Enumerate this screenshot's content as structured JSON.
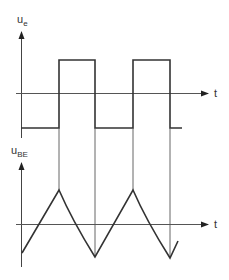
{
  "diagram": {
    "title": "",
    "top_plot": {
      "y_label": "u",
      "y_label_sub": "e",
      "x_label": "t",
      "waveform": "square",
      "levels": [
        "high",
        "low"
      ]
    },
    "bottom_plot": {
      "y_label": "u",
      "y_label_sub": "BE",
      "x_label": "t",
      "waveform": "triangle (capacitor charge/discharge)"
    },
    "colors": {
      "stroke": "#333333",
      "guide": "#555555",
      "background": "#ffffff"
    }
  }
}
